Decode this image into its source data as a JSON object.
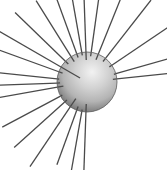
{
  "figure": {
    "canvas": {
      "width": 167,
      "height": 170,
      "background_color": "#ffffff"
    },
    "sphere": {
      "center_x": 87,
      "center_y": 82,
      "radius": 30,
      "highlight_x": 92,
      "highlight_y": 72,
      "highlight_color": "#f2f2f2",
      "mid_color": "#b4b4b4",
      "edge_color": "#6e6e6e",
      "outline_color": "#5a5a5a",
      "outline_width": 0.8
    },
    "rays": {
      "color": "#4a4a4a",
      "width": 1.3,
      "count": 22,
      "inner_radius_default": 26,
      "items": [
        {
          "angle_deg": 268,
          "inner_radius": 22,
          "outer_radius": 92
        },
        {
          "angle_deg": 260,
          "inner_radius": 28,
          "outer_radius": 90
        },
        {
          "angle_deg": 250,
          "inner_radius": 26,
          "outer_radius": 88
        },
        {
          "angle_deg": 236,
          "inner_radius": 20,
          "outer_radius": 102
        },
        {
          "angle_deg": 222,
          "inner_radius": 27,
          "outer_radius": 98
        },
        {
          "angle_deg": 208,
          "inner_radius": 28,
          "outer_radius": 96
        },
        {
          "angle_deg": 190,
          "inner_radius": 24,
          "outer_radius": 92
        },
        {
          "angle_deg": 182,
          "inner_radius": 27,
          "outer_radius": 90
        },
        {
          "angle_deg": 174,
          "inner_radius": 28,
          "outer_radius": 92
        },
        {
          "angle_deg": 160,
          "inner_radius": 26,
          "outer_radius": 96
        },
        {
          "angle_deg": 150,
          "inner_radius": 8,
          "outer_radius": 104
        },
        {
          "angle_deg": 136,
          "inner_radius": 26,
          "outer_radius": 100
        },
        {
          "angle_deg": 122,
          "inner_radius": 24,
          "outer_radius": 96
        },
        {
          "angle_deg": 110,
          "inner_radius": 26,
          "outer_radius": 92
        },
        {
          "angle_deg": 100,
          "inner_radius": 27,
          "outer_radius": 90
        },
        {
          "angle_deg": 92,
          "inner_radius": 22,
          "outer_radius": 92
        },
        {
          "angle_deg": 82,
          "inner_radius": 26,
          "outer_radius": 90
        },
        {
          "angle_deg": 68,
          "inner_radius": 24,
          "outer_radius": 96
        },
        {
          "angle_deg": 52,
          "inner_radius": 26,
          "outer_radius": 104
        },
        {
          "angle_deg": 34,
          "inner_radius": 27,
          "outer_radius": 98
        },
        {
          "angle_deg": 16,
          "inner_radius": 28,
          "outer_radius": 88
        },
        {
          "angle_deg": 6,
          "inner_radius": 26,
          "outer_radius": 86
        }
      ]
    }
  }
}
